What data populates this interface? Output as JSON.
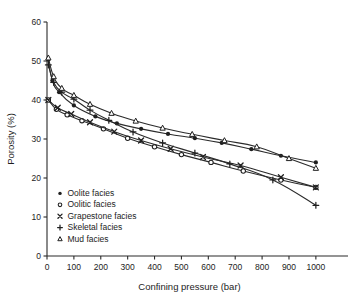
{
  "chart_data": {
    "type": "line",
    "title": "",
    "xlabel": "Confining pressure (bar)",
    "ylabel": "Porosity (%)",
    "xlim": [
      0,
      1060
    ],
    "ylim": [
      0,
      60
    ],
    "xticks": [
      0,
      100,
      200,
      300,
      400,
      500,
      600,
      700,
      800,
      900,
      1000
    ],
    "yticks": [
      0,
      10,
      20,
      30,
      40,
      50,
      60
    ],
    "xtick_labels": [
      "0",
      "100",
      "200",
      "300",
      "400",
      "500",
      "600",
      "700",
      "800",
      "900",
      "1000"
    ],
    "ytick_labels": [
      "0",
      "10",
      "20",
      "30",
      "40",
      "50",
      "60"
    ],
    "grid": false,
    "legend_position": "lower-left-inside",
    "series": [
      {
        "name": "Oolite facies",
        "marker": "filled-circle",
        "x": [
          5,
          20,
          45,
          100,
          180,
          260,
          350,
          450,
          550,
          650,
          760,
          870,
          1000
        ],
        "y": [
          50.3,
          45.0,
          42.0,
          38.6,
          35.8,
          34.0,
          32.6,
          31.3,
          30.2,
          29.0,
          27.4,
          25.7,
          24.0
        ]
      },
      {
        "name": "Oolitic facies",
        "marker": "open-circle",
        "x": [
          5,
          35,
          75,
          130,
          210,
          300,
          400,
          500,
          610,
          730,
          870,
          1000
        ],
        "y": [
          40.0,
          37.6,
          36.2,
          34.7,
          32.6,
          30.2,
          28.0,
          26.0,
          24.0,
          21.8,
          19.5,
          17.6
        ]
      },
      {
        "name": "Grapestone facies",
        "marker": "cross-x",
        "x": [
          5,
          40,
          90,
          160,
          250,
          350,
          460,
          580,
          720,
          870,
          1000
        ],
        "y": [
          40.0,
          38.0,
          36.4,
          34.3,
          31.9,
          29.6,
          27.5,
          25.4,
          23.2,
          20.2,
          17.6
        ]
      },
      {
        "name": "Skeletal facies",
        "marker": "plus",
        "x": [
          5,
          25,
          55,
          100,
          160,
          230,
          320,
          430,
          550,
          680,
          840,
          1000
        ],
        "y": [
          49.0,
          44.5,
          42.0,
          40.2,
          37.4,
          34.8,
          31.8,
          29.0,
          26.4,
          23.6,
          19.5,
          13.0
        ]
      },
      {
        "name": "Mud facies",
        "marker": "open-triangle",
        "x": [
          5,
          25,
          55,
          100,
          160,
          240,
          330,
          430,
          540,
          660,
          780,
          900,
          1000
        ],
        "y": [
          50.8,
          46.0,
          43.0,
          41.2,
          38.9,
          36.6,
          34.6,
          32.8,
          31.2,
          29.6,
          28.0,
          25.0,
          22.5
        ]
      }
    ]
  },
  "legend": {
    "items": [
      {
        "label": "Oolite facies",
        "marker": "filled-circle"
      },
      {
        "label": "Oolitic facies",
        "marker": "open-circle"
      },
      {
        "label": "Grapestone facies",
        "marker": "cross-x"
      },
      {
        "label": "Skeletal facies",
        "marker": "plus"
      },
      {
        "label": "Mud facies",
        "marker": "open-triangle"
      }
    ]
  },
  "colors": {
    "axis": "#2a2a2a",
    "line": "#2b2b2b",
    "marker": "#1f1f1f",
    "background": "#ffffff"
  }
}
